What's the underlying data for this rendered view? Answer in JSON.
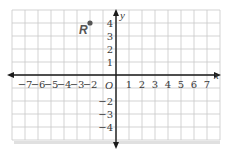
{
  "chart_data": {
    "type": "scatter",
    "title": "",
    "xlabel": "x",
    "ylabel": "y",
    "origin_label": "O",
    "xlim": [
      -8,
      8
    ],
    "ylim": [
      -5,
      5
    ],
    "grid": true,
    "x_ticks": [
      -7,
      -6,
      -5,
      -4,
      -3,
      -2,
      1,
      2,
      3,
      4,
      5,
      6,
      7
    ],
    "y_ticks": [
      4,
      3,
      2,
      1,
      -2,
      -3,
      -4
    ],
    "points": [
      {
        "label": "R",
        "x": -2,
        "y": 4
      }
    ]
  },
  "colors": {
    "grid": "#c8c8c8",
    "axis": "#1a1a1a",
    "point": "#555555",
    "shadow": "#d9d9d9"
  }
}
